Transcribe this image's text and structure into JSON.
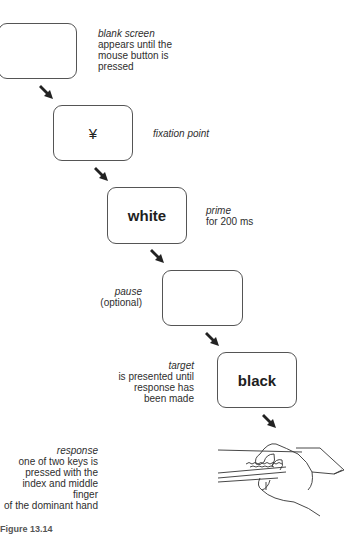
{
  "steps": [
    {
      "name": "blank-screen",
      "box_text": "",
      "title": "blank screen",
      "desc": "appears until the\nmouse button is\npressed"
    },
    {
      "name": "fixation-point",
      "box_text": "¥",
      "title": "fixation point",
      "desc": ""
    },
    {
      "name": "prime",
      "box_text": "white",
      "title": "prime",
      "desc": "for 200 ms"
    },
    {
      "name": "pause",
      "box_text": "",
      "title": "pause",
      "desc": "(optional)"
    },
    {
      "name": "target",
      "box_text": "black",
      "title": "target",
      "desc": "is presented until\nresponse has\nbeen made"
    },
    {
      "name": "response",
      "box_text": "",
      "title": "response",
      "desc": "one of two keys is\npressed with the\nindex and middle finger\nof the dominant hand"
    }
  ],
  "caption": "Figure 13.14",
  "colors": {
    "arrow": "#222222",
    "box_border": "#555555",
    "text": "#2e2e2e"
  }
}
